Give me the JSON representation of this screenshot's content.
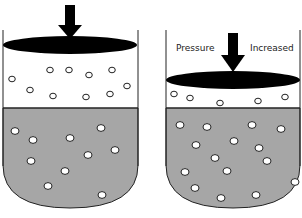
{
  "diagram": {
    "colors": {
      "liquid": "#a6a6a6",
      "outline": "#222222",
      "piston": "#000000",
      "bubble_fill": "#ffffff",
      "background": "#ffffff"
    },
    "left_container": {
      "state": "normal pressure",
      "gas_bubbles": [
        [
          12,
          79
        ],
        [
          30,
          90
        ],
        [
          50,
          70
        ],
        [
          69,
          70
        ],
        [
          89,
          75
        ],
        [
          112,
          70
        ],
        [
          53,
          96
        ],
        [
          86,
          97
        ],
        [
          110,
          94
        ],
        [
          127,
          86
        ]
      ],
      "dissolved_bubbles": [
        [
          15,
          131
        ],
        [
          33,
          140
        ],
        [
          70,
          138
        ],
        [
          101,
          128
        ],
        [
          88,
          155
        ],
        [
          115,
          150
        ],
        [
          31,
          161
        ],
        [
          65,
          171
        ],
        [
          48,
          186
        ],
        [
          102,
          195
        ]
      ]
    },
    "right_container": {
      "state": "increased pressure",
      "labels": {
        "left": "Pressure",
        "right": "Increased"
      },
      "gas_bubbles": [
        [
          174,
          94
        ],
        [
          190,
          98
        ],
        [
          220,
          103
        ],
        [
          258,
          101
        ],
        [
          285,
          97
        ]
      ],
      "dissolved_bubbles": [
        [
          180,
          125
        ],
        [
          207,
          127
        ],
        [
          252,
          125
        ],
        [
          281,
          129
        ],
        [
          196,
          145
        ],
        [
          234,
          141
        ],
        [
          259,
          148
        ],
        [
          215,
          158
        ],
        [
          267,
          161
        ],
        [
          185,
          172
        ],
        [
          227,
          171
        ],
        [
          295,
          182
        ],
        [
          195,
          188
        ],
        [
          221,
          198
        ],
        [
          256,
          195
        ]
      ]
    }
  }
}
